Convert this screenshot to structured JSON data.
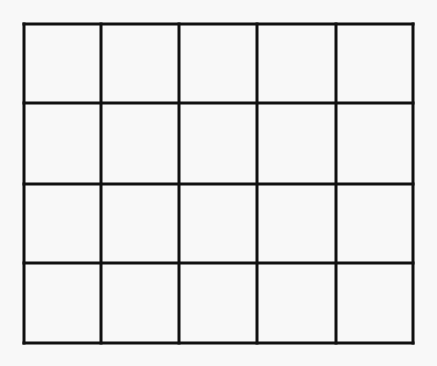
{
  "diagram": {
    "type": "grid",
    "rows": 4,
    "columns": 5,
    "line_color": "#111111",
    "background_color": "#f8f8f8",
    "line_width": 3,
    "vertical_lines_x": [
      24,
      101,
      179,
      257,
      336,
      413
    ],
    "horizontal_lines_y": [
      24,
      103,
      184,
      263,
      343
    ]
  }
}
